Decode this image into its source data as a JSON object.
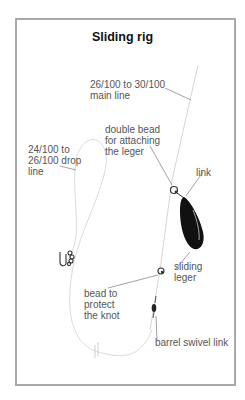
{
  "diagram": {
    "title": "Sliding rig",
    "labels": {
      "main_line_1": "26/100 to 30/100",
      "main_line_2": "main line",
      "double_bead_1": "double bead",
      "double_bead_2": "for attaching",
      "double_bead_3": "the leger",
      "drop_line_1": "24/100 to",
      "drop_line_2": "26/100 drop",
      "drop_line_3": "line",
      "link": "link",
      "sliding_leger_1": "sliding",
      "sliding_leger_2": "leger",
      "bead_knot_1": "bead to",
      "bead_knot_2": "protect",
      "bead_knot_3": "the knot",
      "barrel_swivel": "barrel swivel link"
    },
    "colors": {
      "frame": "#a9a9a9",
      "line": "#d8d8d8",
      "leader": "#8a8a8a",
      "leger": "#111111"
    }
  }
}
